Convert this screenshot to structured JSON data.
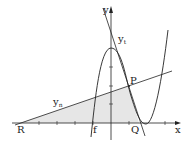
{
  "diagram": {
    "axes": {
      "x_label": "x",
      "y_label": "y"
    },
    "points": {
      "R": "R",
      "P": "P",
      "Q": "Q"
    },
    "curves": {
      "f": "f",
      "tangent_t": {
        "base": "y",
        "sub": "t"
      },
      "tangent_n": {
        "base": "y",
        "sub": "n"
      }
    },
    "colors": {
      "stroke": "#222222",
      "shade": "#e6e6e6"
    }
  }
}
